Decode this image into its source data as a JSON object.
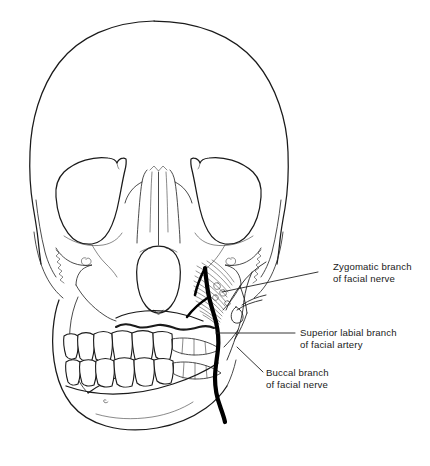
{
  "figure": {
    "background_color": "#ffffff",
    "line_color": "#1a1a1a",
    "artery_color": "#000000"
  },
  "annotations": [
    {
      "id": "zygomatic-branch",
      "line1": "Zygomatic branch",
      "line2": "of facial nerve",
      "structure": "nerve"
    },
    {
      "id": "superior-labial-branch",
      "line1": "Superior labial branch",
      "line2": "of facial artery",
      "structure": "artery"
    },
    {
      "id": "buccal-branch",
      "line1": "Buccal branch",
      "line2": "of facial nerve",
      "structure": "nerve"
    }
  ],
  "structures": {
    "cranium": "calvaria",
    "orbit_left": "left orbit",
    "orbit_right": "right orbit",
    "nasal_aperture": "piriform aperture",
    "maxilla": "maxilla",
    "mandible": "mandible",
    "teeth_upper": "maxillary dentition",
    "teeth_lower": "mandibular dentition",
    "buccinator": "buccinator muscle fibers",
    "infraorbital_foramen": "infraorbital foramen",
    "mental_foramen": "mental foramen"
  }
}
